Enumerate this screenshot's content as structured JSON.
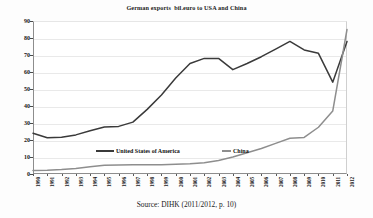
{
  "chart_data": {
    "type": "line",
    "title": "German exports  bil.euro to USA and China",
    "xlabel": "",
    "ylabel": "",
    "ylim": [
      0,
      90
    ],
    "ytick_step": 10,
    "yticks": [
      "0",
      "10",
      "20",
      "30",
      "40",
      "50",
      "60",
      "70",
      "80",
      "90"
    ],
    "grid": true,
    "legend_position": "inside-center",
    "categories": [
      "1990",
      "1991",
      "1992",
      "1993",
      "1994",
      "1995",
      "1996",
      "1997",
      "1998",
      "1999",
      "2000",
      "2001",
      "2002",
      "2003",
      "2004",
      "2005",
      "2006",
      "2007",
      "2008",
      "2009",
      "2010",
      "2011",
      "2012"
    ],
    "series": [
      {
        "name": "United States of America",
        "color": "#3a3a3a",
        "values": [
          24.0,
          21.3,
          21.6,
          23.0,
          25.4,
          27.6,
          28.0,
          30.5,
          38.0,
          46.5,
          56.5,
          65.0,
          68.0,
          68.0,
          61.4,
          65.0,
          69.0,
          73.5,
          78.0,
          73.0,
          71.0,
          54.0,
          78.0
        ]
      },
      {
        "name": "China",
        "color": "#8e8e8e",
        "values": [
          2.0,
          2.2,
          2.6,
          3.2,
          4.3,
          5.1,
          5.3,
          5.4,
          5.4,
          5.5,
          5.7,
          6.0,
          6.6,
          8.0,
          10.0,
          12.5,
          15.0,
          18.0,
          21.0,
          21.5,
          27.5,
          37.0,
          85.0
        ]
      }
    ],
    "annotations": []
  },
  "source": {
    "caption": "Source: DIHK (2011/2012, p. 10)"
  },
  "legend": {
    "usa_label": "United States of America",
    "china_label": "China"
  }
}
